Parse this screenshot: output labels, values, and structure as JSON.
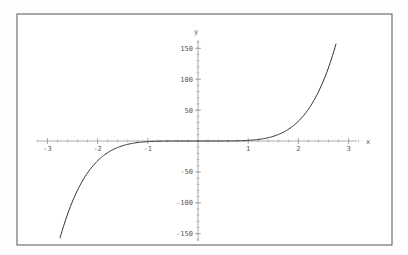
{
  "chart_data": {
    "type": "line",
    "title": "",
    "xlabel": "x",
    "ylabel": "y",
    "function": "y = x^5",
    "xlim": [
      -3.2,
      3.2
    ],
    "ylim": [
      -160,
      160
    ],
    "x_ticks": [
      -3,
      -2,
      -1,
      1,
      2,
      3
    ],
    "x_tick_labels": [
      "-3",
      "-2",
      "-1",
      "1",
      "2",
      "3"
    ],
    "y_ticks": [
      -150,
      -100,
      -50,
      50,
      100,
      150
    ],
    "y_tick_labels": [
      "-150",
      "-100",
      "-50",
      "50",
      "100",
      "150"
    ],
    "grid": false,
    "legend": null,
    "series": [
      {
        "name": "x^5",
        "x": [
          -2.75,
          -2.5,
          -2.25,
          -2.0,
          -1.75,
          -1.5,
          -1.25,
          -1.0,
          -0.5,
          0,
          0.5,
          1.0,
          1.25,
          1.5,
          1.75,
          2.0,
          2.25,
          2.5,
          2.75
        ],
        "values": [
          -157.3,
          -97.7,
          -57.7,
          -32.0,
          -16.4,
          -7.6,
          -3.1,
          -1.0,
          -0.03,
          0,
          0.03,
          1.0,
          3.1,
          7.6,
          16.4,
          32.0,
          57.7,
          97.7,
          157.3
        ]
      }
    ],
    "x_range_plotted": [
      -2.75,
      2.75
    ],
    "colors": {
      "curve": "#333333",
      "axes": "#999999",
      "frame": "#555555"
    }
  }
}
